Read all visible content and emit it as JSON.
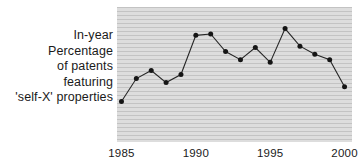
{
  "caption": {
    "lines": [
      "In-year",
      "Percentage",
      "of patents",
      "featuring",
      "'self-X' properties"
    ]
  },
  "colors": {
    "plot_background": "#d2d2d2",
    "gridline": "#c3c3c3",
    "line": "#262626",
    "marker": "#151515",
    "text": "#1a1a1a",
    "page_background": "#ffffff"
  },
  "chart_data": {
    "type": "line",
    "title": "",
    "subtitle": "",
    "xlabel": "",
    "ylabel": "In-year Percentage of patents featuring 'self-X' properties",
    "x": [
      1985,
      1986,
      1987,
      1988,
      1989,
      1990,
      1991,
      1992,
      1993,
      1994,
      1995,
      1996,
      1997,
      1998,
      1999,
      2000
    ],
    "values": [
      30,
      47,
      53,
      44,
      50,
      79,
      80,
      67,
      61,
      70,
      59,
      84,
      71,
      65,
      61,
      41
    ],
    "series": [
      {
        "name": "In-year percentage of patents featuring 'self-X' properties",
        "values": [
          30,
          47,
          53,
          44,
          50,
          79,
          80,
          67,
          61,
          70,
          59,
          84,
          71,
          65,
          61,
          41
        ]
      }
    ],
    "xlim": [
      1984.7,
      2000.5
    ],
    "ylim": [
      0,
      100
    ],
    "xticks": [
      1985,
      1990,
      1995,
      2000
    ],
    "xticklabels": [
      "1985",
      "1990",
      "1995",
      "2000"
    ],
    "yticks": [],
    "yticklabels": [],
    "grid": "horizontal",
    "legend": "none",
    "markers": "filled-circle",
    "annotations": []
  }
}
